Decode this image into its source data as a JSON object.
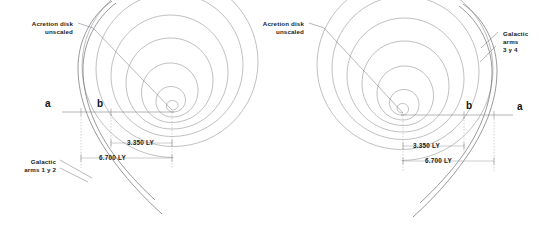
{
  "figure": {
    "background_color": "#ffffff",
    "line_color": "#8c8c90",
    "text_color": "#1a1a1a",
    "width": 549,
    "height": 238
  },
  "left_diagram": {
    "name": "left-galaxy",
    "accretion_label_line1": "Acretion disk",
    "accretion_label_line2": "unscaled",
    "arms_label_line1": "Galactic",
    "arms_label_line2": "arms 1 y 2",
    "point_a": "a",
    "point_b": "b",
    "dim_inner": "3.350 LY",
    "dim_outer": "6.700 LY",
    "center_x": 172,
    "center_y": 110
  },
  "right_diagram": {
    "name": "right-galaxy",
    "accretion_label_line1": "Acretion disk",
    "accretion_label_line2": "unscaled",
    "arms_label_line1": "Galactic",
    "arms_label_line2": "arms",
    "arms_label_line3": "3 y 4",
    "point_a": "a",
    "point_b": "b",
    "dim_inner": "3.350 LY",
    "dim_outer": "6.700 LY",
    "center_x": 403,
    "center_y": 113
  },
  "measurements": {
    "inner_radius_ly": 3.35,
    "outer_radius_ly": 6.7,
    "unit": "LY"
  }
}
